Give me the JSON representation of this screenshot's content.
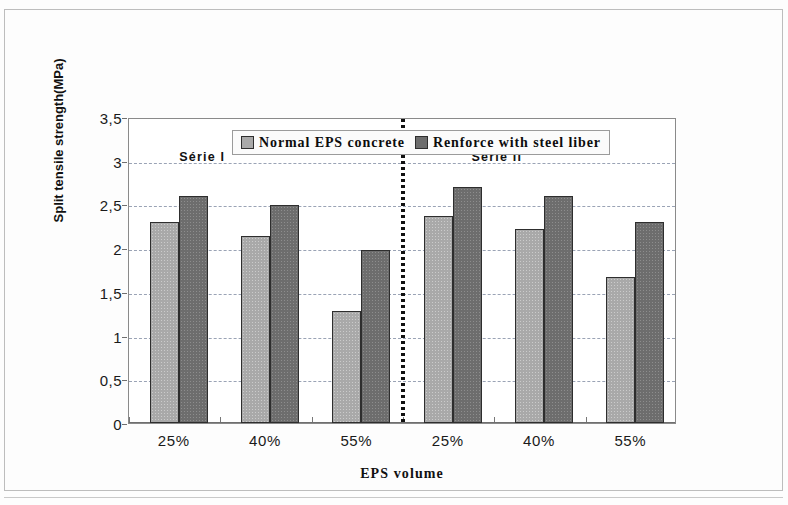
{
  "chart_data": {
    "type": "bar",
    "title": "",
    "xlabel": "EPS volume",
    "ylabel": "Split tensile strength(MPa)",
    "categories": [
      "25%",
      "40%",
      "55%",
      "25%",
      "40%",
      "55%"
    ],
    "series": [
      {
        "name": "Normal EPS concrete",
        "color": "#a9a9a9",
        "values": [
          2.3,
          2.14,
          1.28,
          2.37,
          2.22,
          1.67
        ]
      },
      {
        "name": "Renforce with steel liber",
        "color": "#6d6d6d",
        "values": [
          2.6,
          2.49,
          1.98,
          2.7,
          2.6,
          2.3
        ]
      }
    ],
    "ylim": [
      0,
      3.5
    ],
    "ytick_labels": [
      "0",
      "0,5",
      "1",
      "1,5",
      "2",
      "2,5",
      "3",
      "3,5"
    ],
    "ytick_values": [
      0,
      0.5,
      1,
      1.5,
      2,
      2.5,
      3,
      3.5
    ],
    "grid": true,
    "legend_position": "top-center",
    "annotations": [
      {
        "text": "Série I",
        "x_category_index": 0.55,
        "y": 3.05
      },
      {
        "text": "Série II",
        "x_category_index": 3.75,
        "y": 3.05
      }
    ],
    "divider": {
      "after_category_index": 2,
      "style": "dotted-vertical"
    }
  }
}
